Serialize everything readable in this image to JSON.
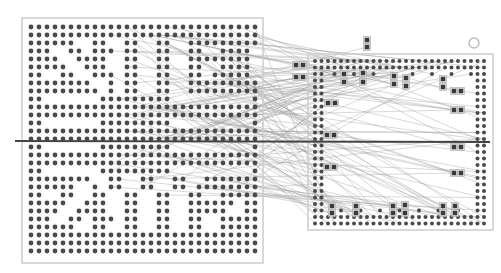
{
  "diagram": {
    "type": "bga-ratsnest",
    "background": "#ffffff",
    "colors": {
      "ball": "#4a4a4a",
      "outline": "#cccccc",
      "pad_fill": "#3a3a3a",
      "pad_border": "#aaaaaa",
      "wire": "#9a9a9a",
      "cut_line": "#444444",
      "fiducial": "#bbbbbb"
    },
    "left_chip": {
      "label": "left-bga",
      "outline": {
        "x": 22,
        "y": 18,
        "w": 241,
        "h": 245
      },
      "origin": {
        "x": 31,
        "y": 27
      },
      "pitch": 8,
      "cols": 29,
      "rows": 29,
      "ball_r": 2.4,
      "pattern": [
        "#############################",
        "#############################",
        "######..##..##..##..#########",
        "###..##.###.##..##..##..####.",
        "####..####..##..##..########.",
        "#####..###..##..##..##..####.",
        "##..##..###.##..##..##.#####.",
        "########..#.##..##..#########",
        "#########.#.##..##..#########",
        "##.......#########..........#",
        "#############################",
        "#############################",
        "##.......#########..........#",
        "#############################",
        "#############################",
        "##.......#########..........#",
        "#############################",
        "#############################",
        "##.......#########..........#",
        "########..##..##..##..######",
        "######..#.##..##..##.#######",
        "##..##..##..##..##..##..####",
        "#####..###..##..##..######.#",
        "####..####..##..##..#####..#",
        "###..##.###.##..##..##..####",
        "######..##..##..##..##..####",
        "#############################",
        "#############################",
        "#############################"
      ]
    },
    "right_chip": {
      "label": "right-bga",
      "outline": {
        "x": 308,
        "y": 54,
        "w": 185,
        "h": 176
      },
      "origin": {
        "x": 315,
        "y": 61
      },
      "pitch": 6.5,
      "cols": 27,
      "rows": 26,
      "ball_r": 2.0,
      "fiducial": {
        "x": 474,
        "y": 43,
        "r": 5
      }
    },
    "pads": [
      {
        "x": 367,
        "y": 40
      },
      {
        "x": 367,
        "y": 47
      },
      {
        "x": 296,
        "y": 65
      },
      {
        "x": 303,
        "y": 65
      },
      {
        "x": 296,
        "y": 77
      },
      {
        "x": 303,
        "y": 77
      },
      {
        "x": 344,
        "y": 74
      },
      {
        "x": 344,
        "y": 82
      },
      {
        "x": 363,
        "y": 73
      },
      {
        "x": 363,
        "y": 82
      },
      {
        "x": 394,
        "y": 76
      },
      {
        "x": 394,
        "y": 84
      },
      {
        "x": 406,
        "y": 78
      },
      {
        "x": 406,
        "y": 86
      },
      {
        "x": 443,
        "y": 79
      },
      {
        "x": 443,
        "y": 87
      },
      {
        "x": 454,
        "y": 91
      },
      {
        "x": 461,
        "y": 91
      },
      {
        "x": 454,
        "y": 110
      },
      {
        "x": 461,
        "y": 110
      },
      {
        "x": 328,
        "y": 103
      },
      {
        "x": 335,
        "y": 103
      },
      {
        "x": 327,
        "y": 135
      },
      {
        "x": 334,
        "y": 135
      },
      {
        "x": 454,
        "y": 147
      },
      {
        "x": 461,
        "y": 147
      },
      {
        "x": 327,
        "y": 167
      },
      {
        "x": 334,
        "y": 167
      },
      {
        "x": 454,
        "y": 173
      },
      {
        "x": 461,
        "y": 173
      },
      {
        "x": 332,
        "y": 206
      },
      {
        "x": 332,
        "y": 213
      },
      {
        "x": 356,
        "y": 206
      },
      {
        "x": 356,
        "y": 213
      },
      {
        "x": 393,
        "y": 206
      },
      {
        "x": 393,
        "y": 213
      },
      {
        "x": 405,
        "y": 205
      },
      {
        "x": 405,
        "y": 213
      },
      {
        "x": 443,
        "y": 206
      },
      {
        "x": 443,
        "y": 213
      },
      {
        "x": 455,
        "y": 206
      },
      {
        "x": 455,
        "y": 213
      }
    ],
    "cut_line": {
      "x1": 15,
      "y1": 141,
      "x2": 490,
      "y2": 142,
      "width": 2
    },
    "wire_count": 140,
    "wire_seed": 7
  }
}
